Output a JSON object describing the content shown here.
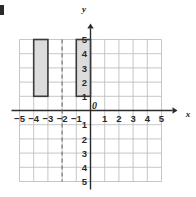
{
  "figure": {
    "kind": "coordinate-grid",
    "background_color": "#ffffff",
    "corner_mark_color": "#2b2b2b"
  },
  "chart_data": {
    "type": "scatter",
    "title": "",
    "xlabel": "x",
    "ylabel": "y",
    "xlim": [
      -5,
      5
    ],
    "ylim": [
      -5,
      5
    ],
    "grid": true,
    "legend": null,
    "x_tick_labels": [
      "−5",
      "−4",
      "−3",
      "−2",
      "−1",
      "1",
      "2",
      "3",
      "4",
      "5"
    ],
    "x_tick_values": [
      -5,
      -4,
      -3,
      -2,
      -1,
      1,
      2,
      3,
      4,
      5
    ],
    "y_tick_labels": [
      "5",
      "4",
      "3",
      "2",
      "1",
      "1",
      "2",
      "3",
      "4",
      "5"
    ],
    "y_tick_values": [
      5,
      4,
      3,
      2,
      1,
      -1,
      -2,
      -3,
      -4,
      -5
    ],
    "origin_label": "0",
    "shapes": [
      {
        "name": "left-rectangle",
        "type": "rectangle",
        "x_min": -4,
        "x_max": -3,
        "y_min": 1,
        "y_max": 5,
        "fill": "#dcdcdc",
        "stroke": "#3a3a3a"
      },
      {
        "name": "right-rectangle",
        "type": "rectangle",
        "x_min": -1,
        "x_max": 0,
        "y_min": 1,
        "y_max": 5,
        "fill": "#dcdcdc",
        "stroke": "#3a3a3a"
      }
    ],
    "reference_lines": [
      {
        "name": "line-of-reflection",
        "orientation": "vertical",
        "value": -2,
        "style": "dashed",
        "color": "#6e6e6e"
      }
    ]
  },
  "style": {
    "grid_line_color": "#b9b9b9",
    "axis_color": "#2a2a2a",
    "shape_fill": "#dcdcdc",
    "shape_stroke": "#3a3a3a",
    "dashed_line_color": "#6e6e6e"
  }
}
